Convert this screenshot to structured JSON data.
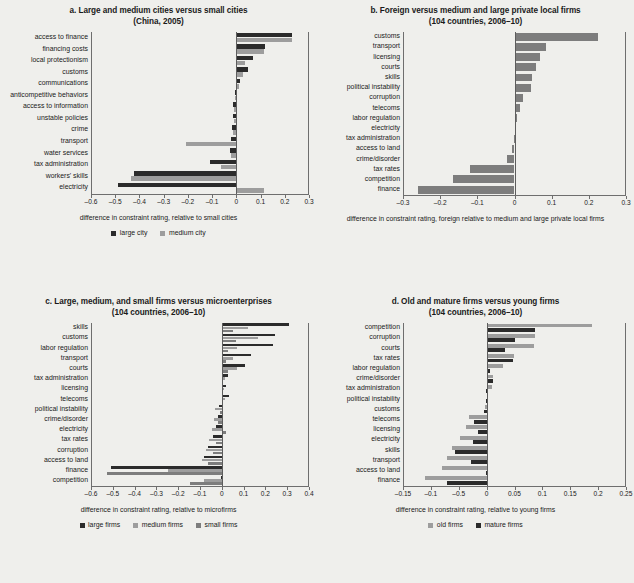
{
  "figure": {
    "background": "#efefec",
    "colors": {
      "dark": "#2b2b2b",
      "mid": "#7d7d7d",
      "light": "#9d9d9d"
    }
  },
  "chart_data": [
    {
      "id": "a",
      "type": "bar",
      "orientation": "horizontal",
      "title": "a.  Large and medium cities versus small cities",
      "subtitle": "(China, 2005)",
      "xlabel": "difference in constraint rating, relative to small cities",
      "ylabel": "",
      "xlim": [
        -0.6,
        0.3
      ],
      "xticks": [
        -0.6,
        -0.5,
        -0.4,
        -0.3,
        -0.2,
        -0.1,
        0,
        0.1,
        0.2,
        0.3
      ],
      "xticklabels": [
        "–0.6",
        "–0.5",
        "–0.4",
        "–0.3",
        "–0.2",
        "–0.1",
        "0",
        "0.1",
        "0.2",
        "0.3"
      ],
      "grid": false,
      "legend_position": "bottom",
      "categories": [
        "access to finance",
        "financing costs",
        "local protectionism",
        "customs",
        "communications",
        "anticompetitive behaviors",
        "access to information",
        "unstable policies",
        "crime",
        "transport",
        "water services",
        "tax administration",
        "workers' skills",
        "electricity"
      ],
      "series": [
        {
          "name": "large city",
          "color": "#2b2b2b",
          "values": [
            0.235,
            0.122,
            0.072,
            0.052,
            0.018,
            -0.004,
            -0.012,
            -0.014,
            -0.016,
            -0.022,
            -0.024,
            -0.108,
            -0.425,
            -0.492
          ]
        },
        {
          "name": "medium city",
          "color": "#9d9d9d",
          "values": [
            0.232,
            0.118,
            0.038,
            0.031,
            0.012,
            -0.003,
            -0.008,
            -0.01,
            -0.012,
            -0.208,
            -0.02,
            -0.062,
            -0.438,
            0.118
          ]
        }
      ]
    },
    {
      "id": "b",
      "type": "bar",
      "orientation": "horizontal",
      "title": "b.  Foreign versus medium and large private local firms",
      "subtitle": "(104 countries, 2006–10)",
      "xlabel": "difference in constraint rating, foreign relative to medium and large private local firms",
      "ylabel": "",
      "xlim": [
        -0.3,
        0.3
      ],
      "xticks": [
        -0.3,
        -0.2,
        -0.1,
        0,
        0.1,
        0.2,
        0.3
      ],
      "xticklabels": [
        "–0.3",
        "–0.2",
        "–0.1",
        "0",
        "0.1",
        "0.2",
        "0.3"
      ],
      "grid": false,
      "legend_position": "none",
      "categories": [
        "customs",
        "transport",
        "licensing",
        "courts",
        "skills",
        "political instability",
        "corruption",
        "telecoms",
        "labor regulation",
        "electricity",
        "tax administration",
        "access to land",
        "crime/disorder",
        "tax rates",
        "competition",
        "finance"
      ],
      "series": [
        {
          "name": "foreign",
          "color": "#7d7d7d",
          "values": [
            0.228,
            0.086,
            0.07,
            0.058,
            0.048,
            0.044,
            0.024,
            0.014,
            0.008,
            0.001,
            -0.002,
            -0.006,
            -0.02,
            -0.121,
            -0.168,
            -0.262
          ]
        }
      ]
    },
    {
      "id": "c",
      "type": "bar",
      "orientation": "horizontal",
      "title": "c.  Large, medium, and small firms versus microenterprises",
      "subtitle": "(104 countries, 2006–10)",
      "xlabel": "difference in constraint rating, relative to microfirms",
      "ylabel": "",
      "xlim": [
        -0.6,
        0.4
      ],
      "xticks": [
        -0.6,
        -0.5,
        -0.4,
        -0.3,
        -0.2,
        -0.1,
        0,
        0.1,
        0.2,
        0.3,
        0.4
      ],
      "xticklabels": [
        "–0.6",
        "–0.5",
        "–0.4",
        "–0.3",
        "–0.2",
        "–0.1",
        "0",
        "0.1",
        "0.2",
        "0.3",
        "0.4"
      ],
      "grid": false,
      "legend_position": "bottom",
      "categories": [
        "skills",
        "customs",
        "labor regulation",
        "transport",
        "courts",
        "tax administration",
        "licensing",
        "telecoms",
        "political instability",
        "crime/disorder",
        "electricity",
        "tax rates",
        "corruption",
        "access to land",
        "finance",
        "competition"
      ],
      "series": [
        {
          "name": "large firms",
          "color": "#2b2b2b",
          "values": [
            0.312,
            0.248,
            0.238,
            0.136,
            0.108,
            0.03,
            0.022,
            0.034,
            -0.01,
            -0.016,
            -0.026,
            -0.042,
            -0.062,
            -0.082,
            -0.51,
            -0.003
          ]
        },
        {
          "name": "medium firms",
          "color": "#9d9d9d",
          "values": [
            0.12,
            0.17,
            0.07,
            0.055,
            0.072,
            0.016,
            0.01,
            0.018,
            -0.03,
            -0.036,
            -0.046,
            -0.058,
            -0.072,
            -0.09,
            -0.248,
            -0.08
          ]
        },
        {
          "name": "small firms",
          "color": "#7d7d7d",
          "values": [
            0.052,
            0.066,
            0.03,
            0.022,
            0.03,
            0.008,
            0.006,
            0.008,
            -0.006,
            -0.018,
            0.02,
            -0.028,
            -0.04,
            -0.064,
            -0.53,
            -0.148
          ]
        }
      ]
    },
    {
      "id": "d",
      "type": "bar",
      "orientation": "horizontal",
      "title": "d.  Old and mature firms versus young firms",
      "subtitle": "(104 countries, 2006–10)",
      "xlabel": "difference in constraint rating, relative to young firms",
      "ylabel": "",
      "xlim": [
        -0.15,
        0.25
      ],
      "xticks": [
        -0.15,
        -0.1,
        -0.05,
        0,
        0.05,
        0.1,
        0.15,
        0.2,
        0.25
      ],
      "xticklabels": [
        "–0.15",
        "–0.1",
        "–0.5",
        "0",
        "0.05",
        "0.1",
        "0.15",
        "0.2",
        "0.25"
      ],
      "grid": false,
      "legend_position": "bottom",
      "categories": [
        "competition",
        "corruption",
        "courts",
        "tax rates",
        "labor regulation",
        "crime/disorder",
        "tax administration",
        "political instability",
        "customs",
        "telecoms",
        "licensing",
        "electricity",
        "skills",
        "transport",
        "access to land",
        "finance"
      ],
      "series": [
        {
          "name": "old firms",
          "color": "#9d9d9d",
          "values": [
            0.19,
            0.088,
            0.085,
            0.049,
            0.029,
            0.011,
            0.009,
            0.0,
            -0.004,
            -0.033,
            -0.038,
            -0.049,
            -0.063,
            -0.072,
            -0.082,
            -0.112
          ]
        },
        {
          "name": "mature firms",
          "color": "#2b2b2b",
          "values": [
            0.088,
            0.051,
            0.032,
            0.047,
            0.005,
            0.011,
            -0.001,
            -0.001,
            -0.005,
            -0.024,
            -0.016,
            -0.026,
            -0.057,
            -0.029,
            -0.002,
            -0.072
          ]
        }
      ]
    }
  ]
}
